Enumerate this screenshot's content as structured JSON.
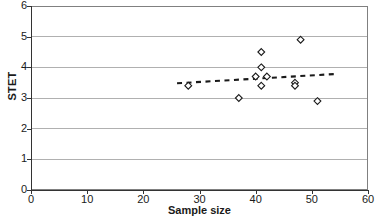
{
  "chart_data": {
    "type": "scatter",
    "title": "",
    "xlabel": "Sample size",
    "ylabel": "STET",
    "xlim": [
      0,
      60
    ],
    "ylim": [
      0,
      6
    ],
    "xticks": [
      0,
      10,
      20,
      30,
      40,
      50,
      60
    ],
    "yticks": [
      0,
      1,
      2,
      3,
      4,
      5,
      6
    ],
    "grid": "horizontal",
    "legend": "none",
    "marker": "open-diamond",
    "marker_color": "#1a1a1a",
    "series": [
      {
        "name": "STET vs sample size",
        "points": [
          {
            "x": 28,
            "y": 3.4
          },
          {
            "x": 37,
            "y": 3.0
          },
          {
            "x": 40,
            "y": 3.7
          },
          {
            "x": 41,
            "y": 4.0
          },
          {
            "x": 41,
            "y": 4.5
          },
          {
            "x": 41,
            "y": 3.4
          },
          {
            "x": 42,
            "y": 3.7
          },
          {
            "x": 47,
            "y": 3.5
          },
          {
            "x": 47,
            "y": 3.4
          },
          {
            "x": 48,
            "y": 4.9
          },
          {
            "x": 51,
            "y": 2.9
          }
        ]
      }
    ],
    "trendline": {
      "style": "dashed",
      "color": "#1a1a1a",
      "x_start": 26,
      "y_start": 3.48,
      "x_end": 54,
      "y_end": 3.78
    }
  }
}
